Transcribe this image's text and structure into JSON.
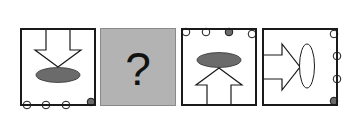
{
  "puzzle": {
    "panels": [
      {
        "id": "panel-1",
        "arrow_direction": "down",
        "ellipse": {
          "orientation": "horizontal",
          "fill": "#6b6b6b"
        },
        "dots": {
          "edge": "bottom",
          "count": 4,
          "filled_index": 3
        }
      },
      {
        "id": "panel-2",
        "question_mark": "?",
        "background": "#b3b3b3"
      },
      {
        "id": "panel-3",
        "arrow_direction": "up",
        "ellipse": {
          "orientation": "horizontal",
          "fill": "#6b6b6b"
        },
        "dots": {
          "edge": "top",
          "count": 4,
          "filled_index": 2
        }
      },
      {
        "id": "panel-4",
        "arrow_direction": "right",
        "ellipse": {
          "orientation": "vertical",
          "fill": "#ffffff"
        },
        "dots": {
          "edge": "right",
          "count": 4,
          "filled_index": 3
        }
      }
    ],
    "colors": {
      "stroke": "#1a1a1a",
      "filled_dot": "#6b6b6b",
      "unknown_panel": "#b3b3b3"
    }
  }
}
